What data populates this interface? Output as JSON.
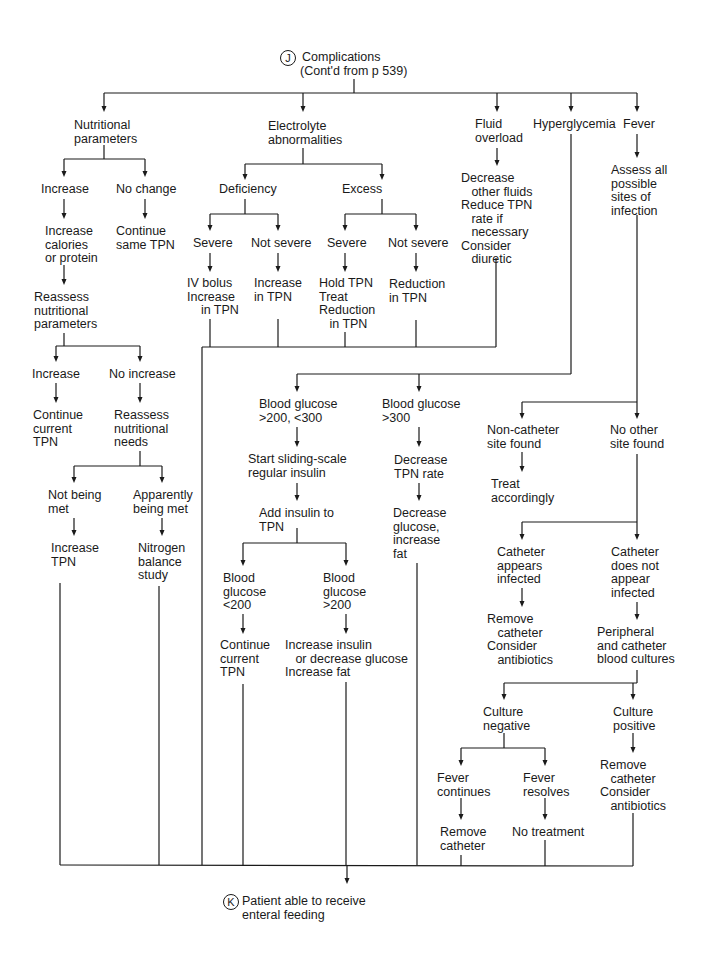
{
  "header": {
    "marker": "J",
    "title": "Complications",
    "subtitle": "(Cont'd from p 539)"
  },
  "footer": {
    "marker": "K",
    "lines": [
      "Patient able to receive",
      "enteral feeding"
    ]
  },
  "nodes": {
    "nutritional_parameters": [
      "Nutritional",
      "parameters"
    ],
    "electrolyte_abnormalities": [
      "Electrolyte",
      "abnormalities"
    ],
    "fluid_overload": [
      "Fluid",
      "overload"
    ],
    "hyperglycemia": [
      "Hyperglycemia"
    ],
    "fever": [
      "Fever"
    ],
    "np_increase": [
      "Increase"
    ],
    "np_no_change": [
      "No change"
    ],
    "increase_calories": [
      "Increase",
      "calories",
      "or protein"
    ],
    "continue_same_tpn": [
      "Continue",
      "same TPN"
    ],
    "reassess_params": [
      "Reassess",
      "nutritional",
      "parameters"
    ],
    "rp_increase": [
      "Increase"
    ],
    "rp_no_increase": [
      "No increase"
    ],
    "continue_current_tpn_1": [
      "Continue",
      "current",
      "TPN"
    ],
    "reassess_needs": [
      "Reassess",
      "nutritional",
      "needs"
    ],
    "not_being_met": [
      "Not being",
      "met"
    ],
    "apparently_being_met": [
      "Apparently",
      "being met"
    ],
    "increase_tpn": [
      "Increase",
      "TPN"
    ],
    "nitrogen_balance": [
      "Nitrogen",
      "balance",
      "study"
    ],
    "deficiency": [
      "Deficiency"
    ],
    "excess": [
      "Excess"
    ],
    "def_severe": [
      "Severe"
    ],
    "def_not_severe": [
      "Not severe"
    ],
    "exc_severe": [
      "Severe"
    ],
    "exc_not_severe": [
      "Not severe"
    ],
    "iv_bolus": [
      "IV bolus",
      "Increase",
      "    in TPN"
    ],
    "increase_in_tpn": [
      "Increase",
      "in TPN"
    ],
    "hold_tpn": [
      "Hold TPN",
      "Treat",
      "Reduction",
      "   in TPN"
    ],
    "reduction_in_tpn": [
      "Reduction",
      "in TPN"
    ],
    "fluid_actions": [
      "Decrease",
      "   other fluids",
      "Reduce TPN",
      "   rate if",
      "   necessary",
      "Consider",
      "   diuretic"
    ],
    "assess_sites": [
      "Assess all",
      "possible",
      "sites of",
      "infection"
    ],
    "bg_200_300": [
      "Blood glucose",
      ">200, <300"
    ],
    "bg_300": [
      "Blood glucose",
      ">300"
    ],
    "sliding_scale": [
      "Start sliding-scale",
      "regular insulin"
    ],
    "add_insulin": [
      "Add insulin to",
      "TPN"
    ],
    "decrease_tpn_rate": [
      "Decrease",
      "TPN rate"
    ],
    "decrease_glucose": [
      "Decrease",
      "glucose,",
      "increase",
      "fat"
    ],
    "bg_lt_200": [
      "Blood",
      "glucose",
      "<200"
    ],
    "bg_gt_200": [
      "Blood",
      "glucose",
      ">200"
    ],
    "continue_current_tpn_2": [
      "Continue",
      "current",
      "TPN"
    ],
    "increase_insulin": [
      "Increase insulin",
      "   or decrease glucose",
      "Increase fat"
    ],
    "non_catheter_site": [
      "Non-catheter",
      "site found"
    ],
    "no_other_site": [
      "No other",
      "site found"
    ],
    "treat_accordingly": [
      "Treat",
      "accordingly"
    ],
    "catheter_infected": [
      "Catheter",
      "appears",
      "infected"
    ],
    "catheter_not_infected": [
      "Catheter",
      "does not",
      "appear",
      "infected"
    ],
    "remove_catheter_antibiotics_1": [
      "Remove",
      "   catheter",
      "Consider",
      "   antibiotics"
    ],
    "blood_cultures": [
      "Peripheral",
      "and catheter",
      "blood cultures"
    ],
    "culture_negative": [
      "Culture",
      "negative"
    ],
    "culture_positive": [
      "Culture",
      "positive"
    ],
    "fever_continues": [
      "Fever",
      "continues"
    ],
    "fever_resolves": [
      "Fever",
      "resolves"
    ],
    "remove_catheter_antibiotics_2": [
      "Remove",
      "   catheter",
      "Consider",
      "   antibiotics"
    ],
    "remove_catheter": [
      "Remove",
      "catheter"
    ],
    "no_treatment": [
      "No treatment"
    ]
  }
}
